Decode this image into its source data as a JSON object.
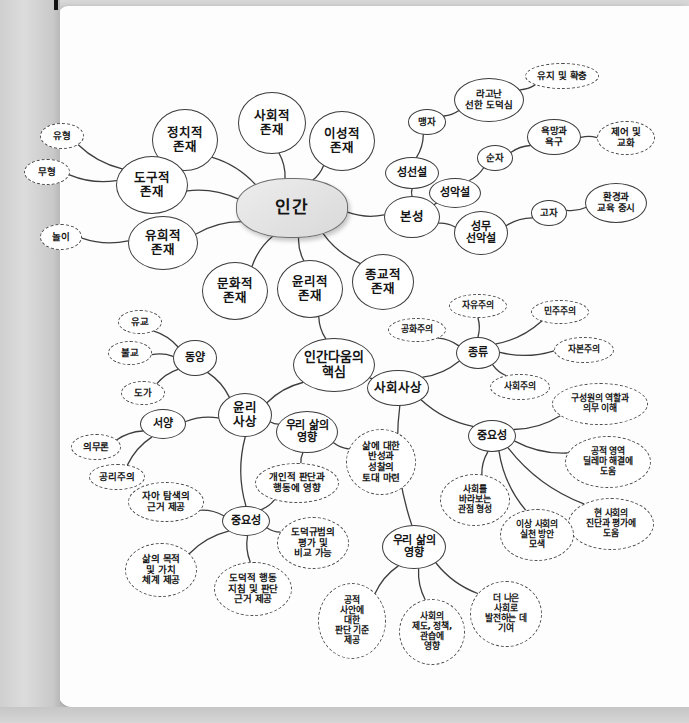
{
  "page": {
    "background_color": "#d8d8d8",
    "paper_color": "#fdfdfd"
  },
  "chart_data": {
    "type": "diagram",
    "roots": [
      "인간",
      "인간다움의 핵심"
    ],
    "node_styles": {
      "center": "gray-filled rounded",
      "branch": "solid outline",
      "leaf": "dashed outline"
    }
  },
  "nodes": [
    {
      "id": "human",
      "label": "인간",
      "style": "center",
      "x": 292,
      "y": 208,
      "w": 112,
      "h": 60,
      "cls": "center"
    },
    {
      "id": "n_social",
      "label": "사회적\n존재",
      "style": "solid",
      "x": 272,
      "y": 123,
      "w": 68,
      "h": 62,
      "cls": "l1"
    },
    {
      "id": "n_political",
      "label": "정치적\n존재",
      "style": "solid",
      "x": 185,
      "y": 140,
      "w": 66,
      "h": 62,
      "cls": "l1"
    },
    {
      "id": "n_rational",
      "label": "이성적\n존재",
      "style": "solid",
      "x": 342,
      "y": 141,
      "w": 66,
      "h": 60,
      "cls": "l1"
    },
    {
      "id": "n_tool",
      "label": "도구적\n존재",
      "style": "solid",
      "x": 152,
      "y": 185,
      "w": 72,
      "h": 58,
      "cls": "l1"
    },
    {
      "id": "n_play",
      "label": "유희적\n존재",
      "style": "solid",
      "x": 163,
      "y": 243,
      "w": 70,
      "h": 54,
      "cls": "l1"
    },
    {
      "id": "n_culture",
      "label": "문화적\n존재",
      "style": "solid",
      "x": 235,
      "y": 291,
      "w": 66,
      "h": 58,
      "cls": "l1"
    },
    {
      "id": "n_ethic_being",
      "label": "윤리적\n존재",
      "style": "solid",
      "x": 310,
      "y": 289,
      "w": 66,
      "h": 58,
      "cls": "l1"
    },
    {
      "id": "n_religion",
      "label": "종교적\n존재",
      "style": "solid",
      "x": 383,
      "y": 282,
      "w": 62,
      "h": 56,
      "cls": "l1"
    },
    {
      "id": "n_nature",
      "label": "본성",
      "style": "solid",
      "x": 412,
      "y": 217,
      "w": 56,
      "h": 42,
      "cls": "l1"
    },
    {
      "id": "n_visible",
      "label": "유형",
      "style": "dashed",
      "x": 62,
      "y": 136,
      "w": 44,
      "h": 26,
      "cls": "l3"
    },
    {
      "id": "n_invisible",
      "label": "무형",
      "style": "dashed",
      "x": 47,
      "y": 172,
      "w": 46,
      "h": 26,
      "cls": "l3"
    },
    {
      "id": "n_playn",
      "label": "놀이",
      "style": "dashed",
      "x": 61,
      "y": 237,
      "w": 42,
      "h": 26,
      "cls": "l3"
    },
    {
      "id": "n_good",
      "label": "성선설",
      "style": "solid",
      "x": 412,
      "y": 173,
      "w": 54,
      "h": 32,
      "cls": "l2"
    },
    {
      "id": "n_evil",
      "label": "성악설",
      "style": "solid",
      "x": 455,
      "y": 193,
      "w": 52,
      "h": 30,
      "cls": "l2"
    },
    {
      "id": "n_neutral",
      "label": "성무\n선악설",
      "style": "solid",
      "x": 481,
      "y": 233,
      "w": 54,
      "h": 44,
      "cls": "l2"
    },
    {
      "id": "n_mencius",
      "label": "맹자",
      "style": "solid",
      "x": 427,
      "y": 122,
      "w": 38,
      "h": 26,
      "cls": "l3"
    },
    {
      "id": "n_xunzi",
      "label": "순자",
      "style": "solid",
      "x": 495,
      "y": 158,
      "w": 36,
      "h": 26,
      "cls": "l3"
    },
    {
      "id": "n_gaozi",
      "label": "고자",
      "style": "solid",
      "x": 549,
      "y": 213,
      "w": 36,
      "h": 26,
      "cls": "l3"
    },
    {
      "id": "n_innate",
      "label": "라고난\n선한 도덕심",
      "style": "solid",
      "x": 489,
      "y": 100,
      "w": 70,
      "h": 44,
      "cls": "l3"
    },
    {
      "id": "n_keep",
      "label": "유지 및 확충",
      "style": "dashed",
      "x": 562,
      "y": 76,
      "w": 74,
      "h": 26,
      "cls": "l3"
    },
    {
      "id": "n_desire",
      "label": "욕망과\n욕구",
      "style": "solid",
      "x": 554,
      "y": 137,
      "w": 54,
      "h": 36,
      "cls": "l3"
    },
    {
      "id": "n_control",
      "label": "제어 및\n교화",
      "style": "dashed",
      "x": 626,
      "y": 138,
      "w": 58,
      "h": 34,
      "cls": "l3"
    },
    {
      "id": "n_env",
      "label": "환경과\n교육 중시",
      "style": "solid",
      "x": 616,
      "y": 203,
      "w": 62,
      "h": 40,
      "cls": "l3"
    },
    {
      "id": "h_core",
      "label": "인간다움의\n핵심",
      "style": "solid",
      "x": 334,
      "y": 365,
      "w": 82,
      "h": 54,
      "cls": "hub"
    },
    {
      "id": "n_ethic_thought",
      "label": "윤리\n사상",
      "style": "solid",
      "x": 245,
      "y": 415,
      "w": 54,
      "h": 44,
      "cls": "l1"
    },
    {
      "id": "n_social_thought",
      "label": "사회사상",
      "style": "solid",
      "x": 398,
      "y": 388,
      "w": 62,
      "h": 36,
      "cls": "l1"
    },
    {
      "id": "n_east",
      "label": "동양",
      "style": "solid",
      "x": 195,
      "y": 358,
      "w": 44,
      "h": 36,
      "cls": "l2"
    },
    {
      "id": "n_west",
      "label": "서양",
      "style": "solid",
      "x": 163,
      "y": 424,
      "w": 46,
      "h": 30,
      "cls": "l2"
    },
    {
      "id": "n_confucian",
      "label": "유교",
      "style": "dashed",
      "x": 140,
      "y": 322,
      "w": 44,
      "h": 24,
      "cls": "l3"
    },
    {
      "id": "n_buddhism",
      "label": "불교",
      "style": "dashed",
      "x": 130,
      "y": 353,
      "w": 44,
      "h": 24,
      "cls": "l3"
    },
    {
      "id": "n_daoism",
      "label": "도가",
      "style": "dashed",
      "x": 143,
      "y": 393,
      "w": 44,
      "h": 24,
      "cls": "l3"
    },
    {
      "id": "n_deontology",
      "label": "의무론",
      "style": "dashed",
      "x": 96,
      "y": 447,
      "w": 50,
      "h": 26,
      "cls": "l3"
    },
    {
      "id": "n_utilitarian",
      "label": "공리주의",
      "style": "dashed",
      "x": 117,
      "y": 477,
      "w": 56,
      "h": 26,
      "cls": "l3"
    },
    {
      "id": "n_e_import",
      "label": "중요성",
      "style": "solid",
      "x": 246,
      "y": 521,
      "w": 48,
      "h": 30,
      "cls": "l2"
    },
    {
      "id": "n_e_i1",
      "label": "자아 탐색의\n근거 제공",
      "style": "dashed",
      "x": 166,
      "y": 502,
      "w": 76,
      "h": 40,
      "cls": "l3"
    },
    {
      "id": "n_e_i2",
      "label": "삶의 목적\n및 가치\n체계 제공",
      "style": "dashed",
      "x": 161,
      "y": 570,
      "w": 72,
      "h": 54,
      "cls": "l3"
    },
    {
      "id": "n_e_i3",
      "label": "도덕적 행동\n지침 및 판단\n근거 제공",
      "style": "dashed",
      "x": 253,
      "y": 589,
      "w": 78,
      "h": 54,
      "cls": "l3"
    },
    {
      "id": "n_e_life",
      "label": "우리 삶의\n영향",
      "style": "solid",
      "x": 307,
      "y": 432,
      "w": 62,
      "h": 42,
      "cls": "l2"
    },
    {
      "id": "n_e_l1",
      "label": "삶에 대한\n반성과\n성찰의\n토대 마련",
      "style": "dashed",
      "x": 381,
      "y": 462,
      "w": 70,
      "h": 66,
      "cls": "l3"
    },
    {
      "id": "n_e_l2",
      "label": "개인적 판단과\n행동에 영향",
      "style": "dashed",
      "x": 297,
      "y": 483,
      "w": 84,
      "h": 40,
      "cls": "l3"
    },
    {
      "id": "n_e_l3",
      "label": "도덕규범의\n평가 및\n비교 가능",
      "style": "dashed",
      "x": 313,
      "y": 543,
      "w": 72,
      "h": 52,
      "cls": "l3"
    },
    {
      "id": "n_s_kind",
      "label": "종류",
      "style": "solid",
      "x": 478,
      "y": 353,
      "w": 44,
      "h": 32,
      "cls": "l2"
    },
    {
      "id": "n_k1",
      "label": "자유주의",
      "style": "dashed",
      "x": 478,
      "y": 306,
      "w": 58,
      "h": 24,
      "cls": "l4"
    },
    {
      "id": "n_k2",
      "label": "공화주의",
      "style": "dashed",
      "x": 417,
      "y": 330,
      "w": 58,
      "h": 24,
      "cls": "l4"
    },
    {
      "id": "n_k3",
      "label": "민주주의",
      "style": "dashed",
      "x": 560,
      "y": 312,
      "w": 58,
      "h": 24,
      "cls": "l4"
    },
    {
      "id": "n_k4",
      "label": "자본주의",
      "style": "dashed",
      "x": 584,
      "y": 350,
      "w": 60,
      "h": 26,
      "cls": "l4"
    },
    {
      "id": "n_k5",
      "label": "사회주의",
      "style": "dashed",
      "x": 520,
      "y": 387,
      "w": 60,
      "h": 26,
      "cls": "l4"
    },
    {
      "id": "n_s_import",
      "label": "중요성",
      "style": "solid",
      "x": 492,
      "y": 436,
      "w": 48,
      "h": 32,
      "cls": "l2"
    },
    {
      "id": "n_s_i1",
      "label": "구성원의 역할과\n의무 이해",
      "style": "dashed",
      "x": 600,
      "y": 404,
      "w": 96,
      "h": 42,
      "cls": "l4"
    },
    {
      "id": "n_s_i2",
      "label": "공적 영역\n딜레마 해결에\n도움",
      "style": "dashed",
      "x": 608,
      "y": 462,
      "w": 86,
      "h": 52,
      "cls": "l4"
    },
    {
      "id": "n_s_i3",
      "label": "현 사회의\n진단과 평가에\n도움",
      "style": "dashed",
      "x": 611,
      "y": 524,
      "w": 86,
      "h": 52,
      "cls": "l4"
    },
    {
      "id": "n_s_i4",
      "label": "사회를\n바라보는\n관점 형성",
      "style": "dashed",
      "x": 475,
      "y": 500,
      "w": 70,
      "h": 52,
      "cls": "l4"
    },
    {
      "id": "n_s_i5",
      "label": "이상 사회의\n실천 방안\n모색",
      "style": "dashed",
      "x": 537,
      "y": 535,
      "w": 74,
      "h": 52,
      "cls": "l4"
    },
    {
      "id": "n_s_life",
      "label": "우리 삶의\n영향",
      "style": "solid",
      "x": 414,
      "y": 547,
      "w": 64,
      "h": 44,
      "cls": "l2"
    },
    {
      "id": "n_sl1",
      "label": "공적\n사안에\n대한\n판단 기준\n제공",
      "style": "dashed",
      "x": 352,
      "y": 621,
      "w": 68,
      "h": 76,
      "cls": "l4"
    },
    {
      "id": "n_sl2",
      "label": "사회의\n제도, 정책,\n관습에\n영향",
      "style": "dashed",
      "x": 432,
      "y": 632,
      "w": 66,
      "h": 66,
      "cls": "l4"
    },
    {
      "id": "n_sl3",
      "label": "더 나은\n사회로\n발전하는 데\n기여",
      "style": "dashed",
      "x": 506,
      "y": 614,
      "w": 72,
      "h": 66,
      "cls": "l4"
    }
  ],
  "links": [
    [
      "human",
      "n_social"
    ],
    [
      "human",
      "n_political"
    ],
    [
      "human",
      "n_rational"
    ],
    [
      "human",
      "n_tool"
    ],
    [
      "human",
      "n_play"
    ],
    [
      "human",
      "n_culture"
    ],
    [
      "human",
      "n_ethic_being"
    ],
    [
      "human",
      "n_religion"
    ],
    [
      "human",
      "n_nature"
    ],
    [
      "n_tool",
      "n_visible"
    ],
    [
      "n_tool",
      "n_invisible"
    ],
    [
      "n_play",
      "n_playn"
    ],
    [
      "n_nature",
      "n_good"
    ],
    [
      "n_nature",
      "n_evil"
    ],
    [
      "n_nature",
      "n_neutral"
    ],
    [
      "n_good",
      "n_mencius"
    ],
    [
      "n_evil",
      "n_xunzi"
    ],
    [
      "n_neutral",
      "n_gaozi"
    ],
    [
      "n_mencius",
      "n_innate"
    ],
    [
      "n_innate",
      "n_keep"
    ],
    [
      "n_xunzi",
      "n_desire"
    ],
    [
      "n_desire",
      "n_control"
    ],
    [
      "n_gaozi",
      "n_env"
    ],
    [
      "n_ethic_being",
      "h_core"
    ],
    [
      "h_core",
      "n_ethic_thought"
    ],
    [
      "h_core",
      "n_social_thought"
    ],
    [
      "n_ethic_thought",
      "n_east"
    ],
    [
      "n_ethic_thought",
      "n_west"
    ],
    [
      "n_east",
      "n_confucian"
    ],
    [
      "n_east",
      "n_buddhism"
    ],
    [
      "n_east",
      "n_daoism"
    ],
    [
      "n_west",
      "n_deontology"
    ],
    [
      "n_west",
      "n_utilitarian"
    ],
    [
      "n_ethic_thought",
      "n_e_import"
    ],
    [
      "n_ethic_thought",
      "n_e_life"
    ],
    [
      "n_e_import",
      "n_e_i1"
    ],
    [
      "n_e_import",
      "n_e_i2"
    ],
    [
      "n_e_import",
      "n_e_i3"
    ],
    [
      "n_e_import",
      "n_e_l2"
    ],
    [
      "n_e_import",
      "n_e_l3"
    ],
    [
      "n_e_life",
      "n_e_l1"
    ],
    [
      "n_e_life",
      "n_e_l2"
    ],
    [
      "n_social_thought",
      "n_s_kind"
    ],
    [
      "n_social_thought",
      "n_s_import"
    ],
    [
      "n_social_thought",
      "n_s_life"
    ],
    [
      "n_s_kind",
      "n_k1"
    ],
    [
      "n_s_kind",
      "n_k2"
    ],
    [
      "n_s_kind",
      "n_k3"
    ],
    [
      "n_s_kind",
      "n_k4"
    ],
    [
      "n_s_kind",
      "n_k5"
    ],
    [
      "n_s_import",
      "n_s_i1"
    ],
    [
      "n_s_import",
      "n_s_i2"
    ],
    [
      "n_s_import",
      "n_s_i3"
    ],
    [
      "n_s_import",
      "n_s_i4"
    ],
    [
      "n_s_import",
      "n_s_i5"
    ],
    [
      "n_s_life",
      "n_sl1"
    ],
    [
      "n_s_life",
      "n_sl2"
    ],
    [
      "n_s_life",
      "n_sl3"
    ]
  ]
}
